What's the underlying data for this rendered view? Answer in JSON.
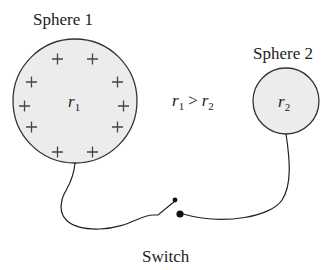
{
  "sphere1": {
    "label": "Sphere 1",
    "radius_symbol": "r",
    "radius_sub": "1",
    "charge_symbol": "+",
    "charge_count": 12
  },
  "sphere2": {
    "label": "Sphere 2",
    "radius_symbol": "r",
    "radius_sub": "2"
  },
  "relation": {
    "left": "r",
    "left_sub": "1",
    "op": ">",
    "right": "r",
    "right_sub": "2"
  },
  "switch": {
    "label": "Switch"
  },
  "colors": {
    "sphere_fill": "#ececec",
    "stroke": "#333333"
  }
}
